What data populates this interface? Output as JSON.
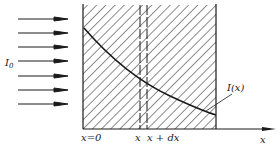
{
  "diagram": {
    "type": "beam-attenuation-through-medium",
    "colors": {
      "ink": "#1a1a1a",
      "background": "#ffffff"
    },
    "incident_beam": {
      "label_main": "I",
      "label_sub": "0",
      "arrow_count": 7
    },
    "medium": {
      "fill": "hatched"
    },
    "slab": {
      "left_label": "x",
      "right_label": "x + dx",
      "right_label_d": "d",
      "style": "dashed"
    },
    "curve": {
      "label": "I(x)",
      "shape": "decaying-exponential"
    },
    "axis": {
      "origin_label": "x=0",
      "axis_label": "x"
    }
  }
}
